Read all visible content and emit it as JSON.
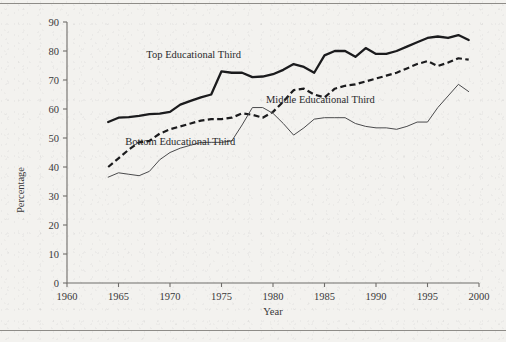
{
  "figure": {
    "has_top_rule": true,
    "has_bottom_rule": true,
    "background_color": "#f3f2ef",
    "ink_color": "#1b1b1d"
  },
  "chart_data": {
    "type": "line",
    "title": "",
    "xlabel": "Year",
    "ylabel": "Percentage",
    "xlim": [
      1960,
      2000
    ],
    "ylim": [
      0,
      90
    ],
    "grid": false,
    "legend_position": "inline-annotations",
    "xticks": [
      1960,
      1965,
      1970,
      1975,
      1980,
      1985,
      1990,
      1995,
      2000
    ],
    "yticks": [
      0,
      10,
      20,
      30,
      40,
      50,
      60,
      70,
      80,
      90
    ],
    "x": [
      1964,
      1965,
      1966,
      1967,
      1968,
      1969,
      1970,
      1971,
      1972,
      1973,
      1974,
      1975,
      1976,
      1977,
      1978,
      1979,
      1980,
      1981,
      1982,
      1983,
      1984,
      1985,
      1986,
      1987,
      1988,
      1989,
      1990,
      1991,
      1992,
      1993,
      1994,
      1995,
      1996,
      1997,
      1998,
      1999
    ],
    "series": [
      {
        "name": "Top Educational Third",
        "style": "solid-thick",
        "color": "#1b1b1d",
        "label_text": "Top Educational Third",
        "label_x": 1972.3,
        "label_y": 77.5,
        "values": [
          55.5,
          57.0,
          57.2,
          57.6,
          58.2,
          58.4,
          59.0,
          61.5,
          62.8,
          64.0,
          65.0,
          73.0,
          72.5,
          72.5,
          71.0,
          71.2,
          72.0,
          73.5,
          75.5,
          74.5,
          72.5,
          78.5,
          80.0,
          80.0,
          78.0,
          81.0,
          79.0,
          79.0,
          80.0,
          81.5,
          83.0,
          84.5,
          85.0,
          84.5,
          85.5,
          83.8
        ]
      },
      {
        "name": "Middle Educational Third",
        "style": "dashed",
        "color": "#1b1b1d",
        "label_text": "Middle Educational Third",
        "label_x": 1984.6,
        "label_y": 62.0,
        "values": [
          40.0,
          43.0,
          46.0,
          48.5,
          49.0,
          51.5,
          53.0,
          54.0,
          55.0,
          56.0,
          56.5,
          56.5,
          57.0,
          58.5,
          58.0,
          57.0,
          59.0,
          62.5,
          66.5,
          67.0,
          65.0,
          64.0,
          67.0,
          68.0,
          68.5,
          69.5,
          70.5,
          71.5,
          72.5,
          74.0,
          75.5,
          76.5,
          74.8,
          76.0,
          77.5,
          77.0
        ]
      },
      {
        "name": "Bottom Educational Third",
        "style": "solid-thin",
        "color": "#4a4a4c",
        "label_text": "Bottom Educational Third",
        "label_x": 1971.0,
        "label_y": 47.5,
        "values": [
          36.5,
          38.0,
          37.5,
          37.0,
          38.5,
          42.5,
          45.0,
          46.5,
          47.5,
          48.5,
          48.5,
          48.5,
          49.0,
          54.5,
          60.5,
          60.5,
          58.5,
          55.0,
          51.0,
          53.5,
          56.5,
          57.0,
          57.0,
          57.0,
          55.0,
          54.0,
          53.5,
          53.5,
          53.0,
          54.0,
          55.5,
          55.5,
          60.5,
          64.5,
          68.5,
          66.0
        ]
      }
    ]
  }
}
